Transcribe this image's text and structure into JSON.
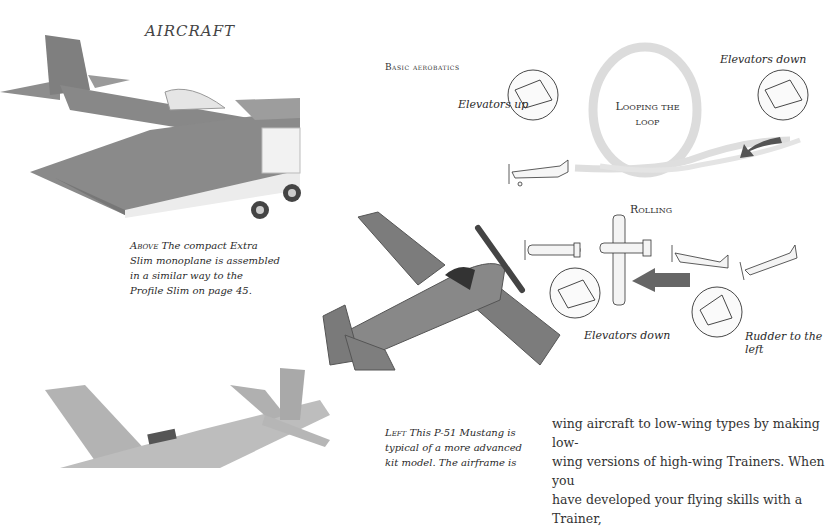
{
  "page": {
    "running_head": "AIRCRAFT",
    "section_heading": "Basic aerobatics"
  },
  "diagram_loop": {
    "title_line1": "Looping the",
    "title_line2": "loop",
    "label_left": "Elevators up",
    "label_right": "Elevators down"
  },
  "diagram_roll": {
    "title": "Rolling",
    "label_elevators": "Elevators down",
    "label_rudder": "Rudder to the left"
  },
  "captions": {
    "above": {
      "lead": "Above",
      "lines": [
        "The compact Extra",
        "Slim monoplane is assembled",
        "in a similar way to the",
        "Profile Slim on page 45."
      ]
    },
    "left": {
      "lead": "Left",
      "lines": [
        "This P-51 Mustang is",
        "typical of a more advanced",
        "kit model. The airframe is"
      ]
    }
  },
  "body": {
    "lines": [
      "wing aircraft to low-wing types by making low-",
      "wing versions of high-wing Trainers. When you",
      "have developed your flying skills with a Trainer,"
    ]
  },
  "colors": {
    "text": "#2a2a2a",
    "photo_gray": "#8a8a8a",
    "smoke": "#d8d8d8",
    "arrow": "#555555"
  }
}
